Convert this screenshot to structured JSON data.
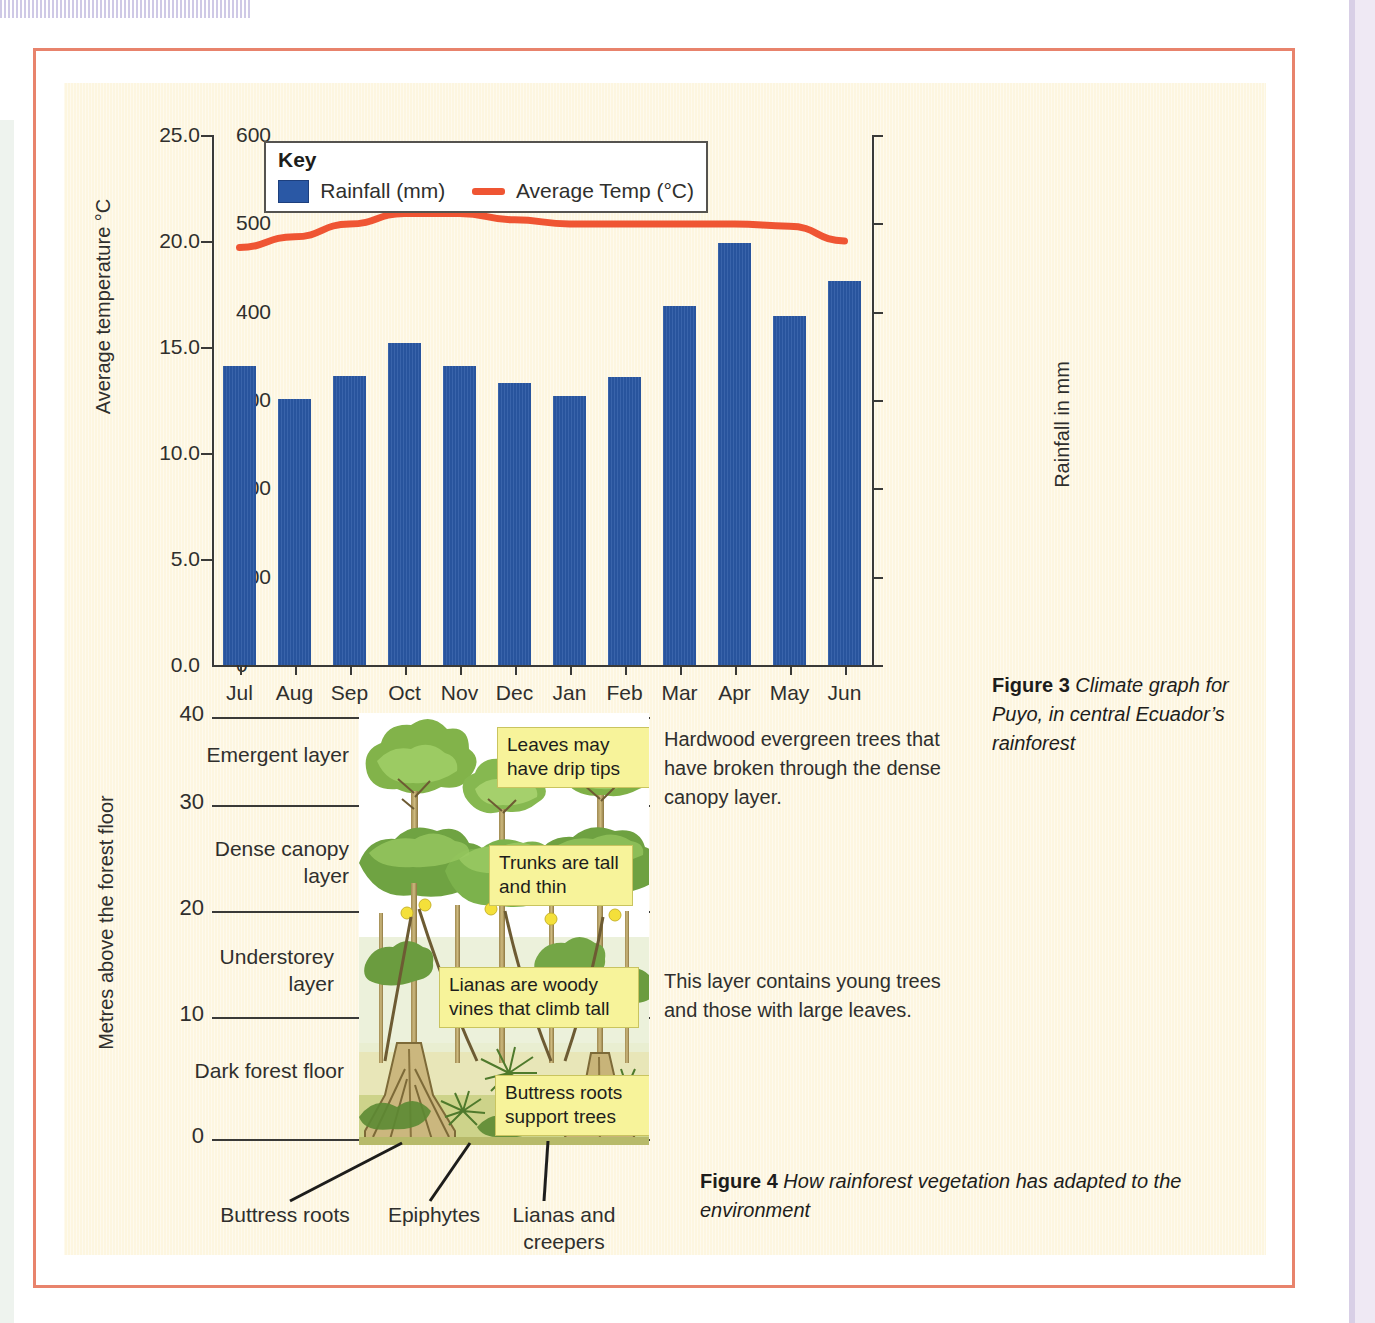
{
  "colors": {
    "page_frame": "#e8836c",
    "paper": "#fdf6e0",
    "bar": "#2a58a5",
    "temp_line": "#ef5533",
    "note_bg": "#f7f39a",
    "axis": "#3a3a38"
  },
  "figure3": {
    "key": {
      "title": "Key",
      "rainfall_label": "Rainfall (mm)",
      "temp_label": "Average Temp (°C)"
    },
    "left_axis_title": "Average temperature °C",
    "right_axis_title": "Rainfall in mm",
    "left_ticks": [
      "25.0",
      "20.0",
      "15.0",
      "10.0",
      "5.0",
      "0.0"
    ],
    "right_ticks": [
      "600",
      "500",
      "400",
      "300",
      "200",
      "100",
      "0"
    ],
    "caption_bold": "Figure 3",
    "caption_text": " Climate graph for Puyo, in central Ecuador’s rainforest"
  },
  "chart_data": {
    "type": "bar",
    "categories": [
      "Jul",
      "Aug",
      "Sep",
      "Oct",
      "Nov",
      "Dec",
      "Jan",
      "Feb",
      "Mar",
      "Apr",
      "May",
      "Jun"
    ],
    "series": [
      {
        "name": "Rainfall (mm)",
        "type": "bar",
        "axis": "right",
        "color": "#2a58a5",
        "values": [
          338,
          301,
          327,
          365,
          338,
          319,
          305,
          326,
          406,
          478,
          395,
          435
        ]
      },
      {
        "name": "Average Temp (°C)",
        "type": "line",
        "axis": "left",
        "color": "#ef5533",
        "values": [
          19.7,
          20.2,
          20.8,
          21.3,
          21.3,
          21.0,
          20.8,
          20.8,
          20.8,
          20.8,
          20.7,
          20.0
        ]
      }
    ],
    "xlabel": "",
    "ylabel": "Average temperature °C",
    "ylabel_right": "Rainfall in mm",
    "ylim": [
      0,
      25
    ],
    "ylim_right": [
      0,
      600
    ],
    "grid": false,
    "legend": "inside-top-left"
  },
  "figure4": {
    "y_axis_title": "Metres above the forest floor",
    "y_ticks": [
      "40",
      "30",
      "20",
      "10",
      "0"
    ],
    "layers": [
      {
        "label": "Emergent layer"
      },
      {
        "label": "Dense canopy layer"
      },
      {
        "label": "Understorey layer"
      },
      {
        "label": "Dark forest floor"
      }
    ],
    "notes": [
      {
        "text": "Leaves may have drip tips"
      },
      {
        "text": "Trunks are tall and thin"
      },
      {
        "text": "Lianas are woody vines that climb tall"
      },
      {
        "text": "Buttress roots support trees"
      }
    ],
    "side_texts": [
      {
        "text": "Hardwood evergreen trees that have broken through the dense canopy layer."
      },
      {
        "text": "This layer contains young trees and those with large leaves."
      }
    ],
    "bottom_labels": [
      "Buttress roots",
      "Epiphytes",
      "Lianas and creepers"
    ],
    "caption_bold": "Figure 4",
    "caption_text": " How rainforest vegetation has adapted to the environment"
  }
}
